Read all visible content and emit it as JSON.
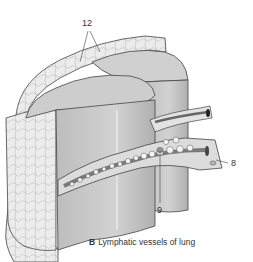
{
  "figure": {
    "caption_letter": "B",
    "caption_text": "Lymphatic vessels of lung",
    "labels": [
      {
        "id": "12",
        "x": 82,
        "y": 19
      },
      {
        "id": "8",
        "x": 231,
        "y": 159
      },
      {
        "id": "9",
        "x": 157,
        "y": 206
      }
    ],
    "colors": {
      "lung_surface": "#c9c9c9",
      "lung_dark": "#a8a8a8",
      "pleura_tissue": "#e8e8e8",
      "outline": "#444444",
      "vessel_light": "#f2f2f2",
      "vessel_dark": "#7a7a7a"
    }
  }
}
